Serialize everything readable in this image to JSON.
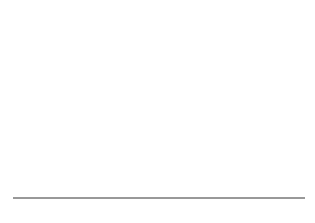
{
  "chart_data": {
    "type": "line",
    "title": "",
    "xlabel": "",
    "ylabel": "",
    "xlim": [
      -1,
      1
    ],
    "ylim": [
      0,
      1
    ],
    "grid": false,
    "legend": null,
    "series": [
      {
        "name": "gaussian",
        "function": "exp(-x^2/(2*sigma^2))",
        "sigma": 0.1,
        "mean": 0,
        "color": "#222222",
        "x": [
          -1,
          -0.4,
          -0.35,
          -0.3,
          -0.25,
          -0.2,
          -0.15,
          -0.1,
          -0.05,
          0,
          0.05,
          0.1,
          0.15,
          0.2,
          0.25,
          0.3,
          0.35,
          0.4,
          1
        ],
        "y": [
          0,
          0.0003,
          0.0022,
          0.011,
          0.044,
          0.135,
          0.325,
          0.607,
          0.882,
          1.0,
          0.882,
          0.607,
          0.325,
          0.135,
          0.044,
          0.011,
          0.0022,
          0.0003,
          0
        ]
      }
    ],
    "tick_labels": [
      {
        "value": -1,
        "label": "-1"
      },
      {
        "value": -0.1,
        "label": "−σ"
      },
      {
        "value": 0,
        "label": "0"
      },
      {
        "value": 0.1,
        "label": "σ"
      },
      {
        "value": 1,
        "label": "1"
      }
    ],
    "minor_tick_step": 0.1
  }
}
